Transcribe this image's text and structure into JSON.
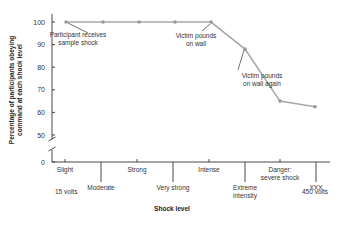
{
  "chart_data": {
    "type": "line",
    "title": "",
    "xlabel": "Shock level",
    "ylabel": "Percentage of participants obeying command at each shock level",
    "ylabel_lines": [
      "Percentage of participants obeying",
      "command at each shock level"
    ],
    "y_ticks": [
      0,
      50,
      60,
      70,
      80,
      90,
      100
    ],
    "ylim": [
      0,
      100
    ],
    "y_axis_break": "between 0 and 50",
    "categories": [
      "Slight",
      "Moderate",
      "Strong",
      "Very strong",
      "Intense",
      "Extreme intensity",
      "Danger: severe shock",
      "XXX"
    ],
    "category_lines": [
      [
        "Slight"
      ],
      [
        "Moderate"
      ],
      [
        "Strong"
      ],
      [
        "Very strong"
      ],
      [
        "Intense"
      ],
      [
        "Extreme",
        "intensity"
      ],
      [
        "Danger:",
        "severe shock"
      ],
      [
        "XXX"
      ]
    ],
    "range_labels": {
      "start": "15 volts",
      "end": "450 volts"
    },
    "series": [
      {
        "name": "Obedience",
        "values": [
          100,
          100,
          100,
          100,
          100,
          88,
          65,
          62.5
        ],
        "color": "#a8a8a8"
      }
    ],
    "annotations": [
      {
        "text_lines": [
          "Participant receives",
          "sample shock"
        ],
        "point_index": 0
      },
      {
        "text_lines": [
          "Victim pounds",
          "on wall"
        ],
        "point_index": 4
      },
      {
        "text_lines": [
          "Victim pounds",
          "on wall again"
        ],
        "point_index": 5
      }
    ],
    "grid": false,
    "legend": "none"
  }
}
